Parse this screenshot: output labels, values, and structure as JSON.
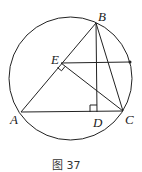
{
  "figure": {
    "caption": "图 37",
    "circle": {
      "cx": 70.5,
      "cy": 78.5,
      "r": 61.5
    },
    "points": {
      "A": {
        "label": "A",
        "x": 21,
        "y": 112
      },
      "B": {
        "label": "B",
        "x": 96,
        "y": 23
      },
      "C": {
        "label": "C",
        "x": 123,
        "y": 111
      },
      "D": {
        "label": "D",
        "x": 97,
        "y": 112
      },
      "E": {
        "label": "E",
        "x": 61,
        "y": 63
      },
      "P": {
        "label": "",
        "x": 130,
        "y": 62
      }
    },
    "segments": [
      "AB",
      "BC",
      "AC",
      "BD",
      "EC",
      "EP"
    ],
    "right_angles": [
      "at E between EA/EC",
      "at D between DB/DA"
    ],
    "stroke_color": "#222222"
  }
}
